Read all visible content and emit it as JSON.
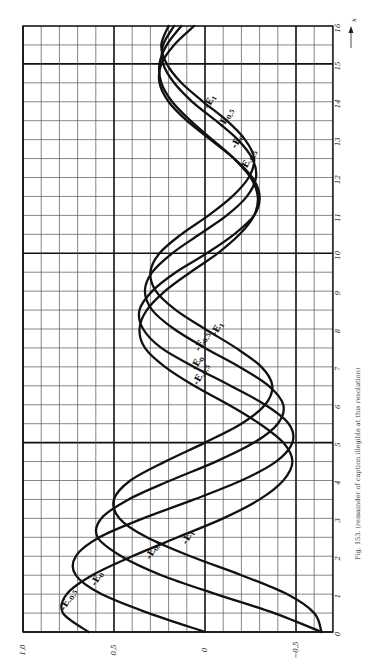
{
  "chart_data": {
    "type": "line",
    "orientation": "rotated-90-ccw",
    "title": "",
    "caption": "Fig. 153. (remainder of caption illegible at this resolution)",
    "xlabel": "x",
    "ylabel": "",
    "xlim": [
      0,
      16
    ],
    "ylim": [
      -0.7,
      1.0
    ],
    "x_ticks": [
      0,
      1,
      2,
      3,
      4,
      5,
      6,
      7,
      8,
      9,
      10,
      11,
      12,
      13,
      14,
      15,
      16
    ],
    "x_tick_labels": [
      "0",
      "1",
      "2",
      "3",
      "4",
      "5",
      "6",
      "7",
      "8",
      "9",
      "10",
      "11",
      "12",
      "13",
      "14",
      "15",
      "16"
    ],
    "y_ticks": [
      1.0,
      0.5,
      0,
      -0.5
    ],
    "y_tick_labels": [
      "1,0",
      "0,5",
      "0",
      "−0,5"
    ],
    "grid": true,
    "grid_minor_x_step": 0.5,
    "grid_minor_y_step": 0.1,
    "grid_major_x": [
      0,
      5,
      10,
      15
    ],
    "grid_major_y": [
      1.0,
      0.5,
      0,
      -0.5
    ],
    "data_note": "Series for nu=0 and nu=1 are computed from the closed-form Weber-function series. Series for nu=-0.5 and nu=0.5 are approximations generated by phase-shifting those series; they were not read from the image and are not true Weber-function values.",
    "x": [
      0,
      0.5,
      1,
      1.5,
      2,
      2.5,
      3,
      3.5,
      4,
      4.5,
      5,
      5.5,
      6,
      6.5,
      7,
      7.5,
      8,
      8.5,
      9,
      9.5,
      10,
      10.5,
      11,
      11.5,
      12,
      12.5,
      13,
      13.5,
      14,
      14.5,
      15,
      15.5,
      16
    ],
    "series": [
      {
        "name": "-E_{-0.5}",
        "label_main": "-E",
        "label_sub": "-0,5",
        "source": "approximated by phase-shift, not read from image",
        "values": [
          0.64,
          0.78,
          0.76,
          0.62,
          0.4,
          0.15,
          -0.1,
          -0.3,
          -0.43,
          -0.48,
          -0.43,
          -0.3,
          -0.13,
          0.06,
          0.22,
          0.33,
          0.36,
          0.32,
          0.22,
          0.08,
          -0.07,
          -0.19,
          -0.27,
          -0.29,
          -0.25,
          -0.16,
          -0.04,
          0.08,
          0.18,
          0.24,
          0.25,
          0.21,
          0.13
        ]
      },
      {
        "name": "-E_0",
        "label_main": "-E",
        "label_sub": "0",
        "source": "computed",
        "values": [
          0.0,
          0.31,
          0.57,
          0.71,
          0.71,
          0.58,
          0.34,
          0.06,
          -0.2,
          -0.39,
          -0.48,
          -0.46,
          -0.33,
          -0.14,
          0.06,
          0.24,
          0.34,
          0.36,
          0.29,
          0.16,
          -0.01,
          -0.16,
          -0.27,
          -0.3,
          -0.26,
          -0.16,
          -0.03,
          0.1,
          0.2,
          0.25,
          0.24,
          0.17,
          0.06
        ]
      },
      {
        "name": "-E_{0.5}",
        "label_main": "-E",
        "label_sub": "0,5",
        "source": "approximated by phase-shift, not read from image",
        "values": [
          -0.64,
          -0.38,
          -0.06,
          0.24,
          0.46,
          0.59,
          0.57,
          0.42,
          0.19,
          -0.06,
          -0.27,
          -0.4,
          -0.43,
          -0.35,
          -0.19,
          0.0,
          0.17,
          0.29,
          0.33,
          0.29,
          0.18,
          0.03,
          -0.12,
          -0.23,
          -0.28,
          -0.26,
          -0.18,
          -0.06,
          0.07,
          0.17,
          0.23,
          0.23,
          0.17
        ]
      },
      {
        "name": "-E_1",
        "label_main": "-E",
        "label_sub": "1",
        "source": "computed",
        "values": [
          -0.64,
          -0.6,
          -0.45,
          -0.2,
          0.08,
          0.32,
          0.47,
          0.5,
          0.41,
          0.22,
          0.0,
          -0.2,
          -0.33,
          -0.37,
          -0.31,
          -0.17,
          0.0,
          0.16,
          0.27,
          0.3,
          0.25,
          0.13,
          -0.02,
          -0.15,
          -0.24,
          -0.27,
          -0.22,
          -0.12,
          0.01,
          0.13,
          0.21,
          0.24,
          0.2
        ]
      }
    ],
    "label_positions": [
      {
        "series": 0,
        "x": 0.55,
        "y": 0.77
      },
      {
        "series": 1,
        "x": 1.2,
        "y": 0.6
      },
      {
        "series": 2,
        "x": 1.9,
        "y": 0.3
      },
      {
        "series": 3,
        "x": 2.3,
        "y": 0.1
      },
      {
        "series": 0,
        "x": 6.5,
        "y": 0.04
      },
      {
        "series": 1,
        "x": 6.9,
        "y": 0.05
      },
      {
        "series": 2,
        "x": 7.4,
        "y": 0.03
      },
      {
        "series": 3,
        "x": 7.8,
        "y": -0.06
      },
      {
        "series": 0,
        "x": 12.15,
        "y": -0.22
      },
      {
        "series": 1,
        "x": 12.75,
        "y": -0.17
      },
      {
        "series": 2,
        "x": 13.3,
        "y": -0.1
      },
      {
        "series": 3,
        "x": 13.8,
        "y": -0.02
      }
    ],
    "axis_arrow_label": "x"
  }
}
